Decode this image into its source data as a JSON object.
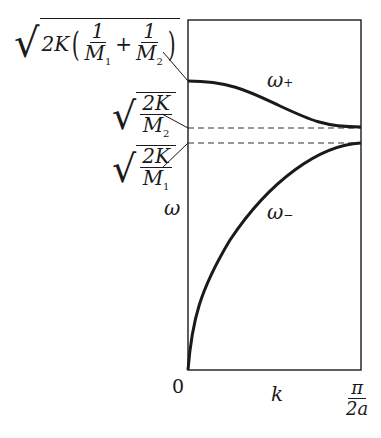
{
  "diagram": {
    "type": "dispersion-relation",
    "axes": {
      "x_label": "k",
      "y_label": "ω",
      "origin_label": "0",
      "x_max_label": {
        "numerator": "π",
        "denominator": "2a"
      }
    },
    "curves": [
      {
        "name": "optical-branch",
        "label": "ω",
        "label_subscript": "+"
      },
      {
        "name": "acoustic-branch",
        "label": "ω",
        "label_subscript": "−"
      }
    ],
    "levels": [
      {
        "name": "optical-max",
        "expr_prefix": "2K",
        "frac1_num": "1",
        "frac1_den": "M",
        "frac1_den_sub": "1",
        "plus": "+",
        "frac2_num": "1",
        "frac2_den": "M",
        "frac2_den_sub": "2"
      },
      {
        "name": "optical-min",
        "num": "2K",
        "den": "M",
        "den_sub": "2"
      },
      {
        "name": "acoustic-max",
        "num": "2K",
        "den": "M",
        "den_sub": "1"
      }
    ],
    "colors": {
      "line": "#1a1a1a",
      "dash": "#333333",
      "background": "#ffffff"
    }
  }
}
